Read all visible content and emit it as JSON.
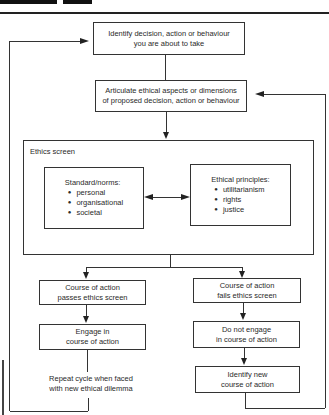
{
  "header": {
    "tabs": [
      {
        "name": "figure-tab-black"
      },
      {
        "name": "figure-tab-number"
      }
    ]
  },
  "diagram": {
    "step1": {
      "line1": "Identify decision, action or behaviour",
      "line2": "you are about to take"
    },
    "step2": {
      "line1": "Articulate ethical aspects or dimensions",
      "line2": "of proposed decision, action or behaviour"
    },
    "ethics_screen": {
      "label": "Ethics screen",
      "standards": {
        "title": "Standard/norms:",
        "items": [
          "personal",
          "organisational",
          "societal"
        ]
      },
      "principles": {
        "title": "Ethical principles:",
        "items": [
          "utilitarianism",
          "rights",
          "justice"
        ]
      }
    },
    "pass_branch": {
      "result": {
        "line1": "Course of action",
        "line2": "passes ethics screen"
      },
      "action": {
        "line1": "Engage in",
        "line2": "course of action"
      },
      "repeat": {
        "line1": "Repeat cycle when faced",
        "line2": "with new ethical dilemma"
      }
    },
    "fail_branch": {
      "result": {
        "line1": "Course of action",
        "line2": "fails ethics screen"
      },
      "action": {
        "line1": "Do not engage",
        "line2": "in course of action"
      },
      "next": {
        "line1": "Identify new",
        "line2": "course of action"
      }
    }
  }
}
